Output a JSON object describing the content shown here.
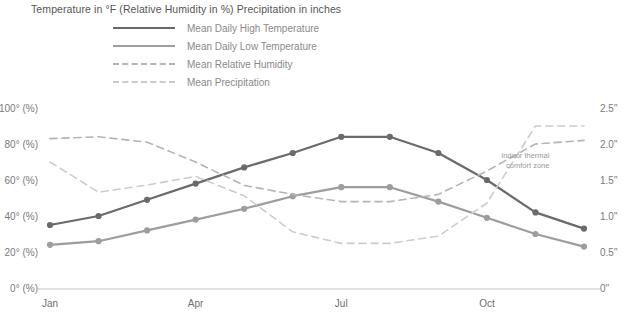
{
  "chart_data": {
    "type": "line",
    "title": "Temperature in °F (Relative Humidity in %) Precipitation in inches",
    "xlabel": "",
    "ylabel": "",
    "grid": false,
    "legend_position": "top",
    "categories": [
      "Jan",
      "Feb",
      "Mar",
      "Apr",
      "May",
      "Jun",
      "Jul",
      "Aug",
      "Sep",
      "Oct",
      "Nov",
      "Dec"
    ],
    "x_tick_labels": [
      "Jan",
      "Apr",
      "Jul",
      "Oct"
    ],
    "x_tick_categories": [
      "Jan",
      "Apr",
      "Jul",
      "Oct"
    ],
    "left_axis": {
      "label": "Temperature in °F / Relative Humidity in %",
      "ticks": [
        "100° (%)",
        "80° (%)",
        "60° (%)",
        "40° (%)",
        "20° (%)",
        "0° (%)"
      ],
      "tick_values": [
        100,
        80,
        60,
        40,
        20,
        0
      ],
      "ylim": [
        0,
        100
      ]
    },
    "right_axis": {
      "label": "Precipitation in inches",
      "ticks": [
        "2.5\"",
        "2.0\"",
        "1.5\"",
        "1.0\"",
        "0.5\"",
        "0\""
      ],
      "tick_values": [
        2.5,
        2.0,
        1.5,
        1.0,
        0.5,
        0
      ],
      "ylim": [
        0,
        2.5
      ]
    },
    "series": [
      {
        "name": "Mean Daily High Temperature",
        "axis": "left",
        "style": "solid",
        "color": "#6a6a6a",
        "markers": true,
        "values": [
          35,
          40,
          49,
          58,
          67,
          75,
          84,
          84,
          75,
          60,
          42,
          33
        ]
      },
      {
        "name": "Mean Daily Low Temperature",
        "axis": "left",
        "style": "solid",
        "color": "#9d9d9d",
        "markers": true,
        "values": [
          24,
          26,
          32,
          38,
          44,
          51,
          56,
          56,
          48,
          39,
          30,
          23
        ]
      },
      {
        "name": "Mean Relative Humidity",
        "axis": "left",
        "style": "dashed",
        "color": "#b4b4b4",
        "markers": false,
        "values": [
          83,
          84,
          81,
          70,
          57,
          52,
          48,
          48,
          52,
          65,
          80,
          82
        ]
      },
      {
        "name": "Mean Precipitation",
        "axis": "right",
        "style": "dashed",
        "color": "#cccccc",
        "markers": false,
        "values": [
          1.75,
          1.33,
          1.43,
          1.55,
          1.28,
          0.78,
          0.62,
          0.62,
          0.72,
          1.18,
          2.25,
          2.25
        ]
      }
    ],
    "annotations": [
      {
        "text_line_1": "indoor thermal",
        "text_line_2": "comfort zone",
        "x_category": "Nov",
        "y_value": 67
      }
    ]
  },
  "legend": {
    "items": [
      {
        "label": "Mean Daily High Temperature",
        "color": "#6a6a6a",
        "style": "solid"
      },
      {
        "label": "Mean Daily Low Temperature",
        "color": "#9d9d9d",
        "style": "solid"
      },
      {
        "label": "Mean Relative Humidity",
        "color": "#b4b4b4",
        "style": "dashed"
      },
      {
        "label": "Mean Precipitation",
        "color": "#cccccc",
        "style": "dashed"
      }
    ]
  },
  "colors": {
    "axis_line": "#d8d8d8",
    "background": "#ffffff",
    "title_text": "#555555",
    "tick_text": "#7a7a7a",
    "annotation_text": "#9a9a9a"
  }
}
